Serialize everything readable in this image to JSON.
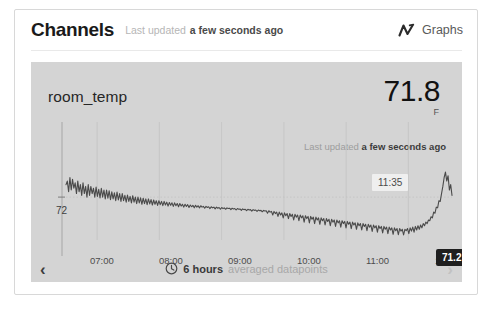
{
  "header": {
    "title": "Channels",
    "updated_prefix": "Last updated",
    "updated_value": "a few seconds ago",
    "graphs_label": "Graphs",
    "graphs_icon": "line-chart-icon"
  },
  "panel": {
    "series_name": "room_temp",
    "current_value": "71.8",
    "unit": "F",
    "updated_prefix": "Last updated",
    "updated_value": "a few seconds ago",
    "time_marker": "11:35",
    "tooltip_value": "71.2 F",
    "footer_bold": "6 hours",
    "footer_dim": "averaged datapoints",
    "footer_icon": "clock-icon",
    "nav_prev": "‹",
    "nav_next": "›",
    "bg_color": "#d4d4d4",
    "line_color": "#4a4a4a",
    "tooltip_bg": "#1f1f1f",
    "marker_bg": "#efefef"
  },
  "chart_data": {
    "type": "line",
    "title": "room_temp",
    "xlabel": "",
    "ylabel": "",
    "grid": true,
    "legend": "none",
    "xlim": [
      "06:30",
      "12:00"
    ],
    "ylim": [
      70.8,
      72.9
    ],
    "yticks": [
      72
    ],
    "ytick_labels": [
      "72"
    ],
    "xticks": [
      "07:00",
      "08:00",
      "09:00",
      "10:00",
      "11:00",
      "12:00"
    ],
    "annotations": [
      {
        "label": "11:35",
        "type": "time-marker"
      },
      {
        "label": "71.2 F",
        "type": "value-tooltip"
      }
    ],
    "series": [
      {
        "name": "room_temp",
        "unit": "F",
        "values": [
          72.35,
          72.45,
          72.15,
          72.55,
          72.2,
          72.5,
          72.25,
          72.4,
          72.1,
          72.45,
          72.15,
          72.35,
          72.05,
          72.4,
          72.1,
          72.3,
          72.0,
          72.35,
          72.05,
          72.3,
          72.1,
          72.25,
          72.0,
          72.28,
          72.02,
          72.22,
          71.98,
          72.25,
          72.0,
          72.2,
          71.95,
          72.2,
          71.97,
          72.18,
          71.93,
          72.15,
          71.95,
          72.12,
          71.9,
          72.14,
          71.92,
          72.1,
          71.88,
          72.1,
          71.9,
          72.05,
          71.86,
          72.06,
          71.88,
          72.02,
          71.84,
          72.04,
          71.86,
          72.0,
          71.82,
          72.0,
          71.84,
          71.98,
          71.8,
          71.97,
          71.82,
          71.95,
          71.79,
          71.95,
          71.81,
          71.93,
          71.78,
          71.92,
          71.8,
          71.9,
          71.77,
          71.9,
          71.79,
          71.88,
          71.76,
          71.88,
          71.78,
          71.86,
          71.75,
          71.85,
          71.77,
          71.84,
          71.74,
          71.84,
          71.76,
          71.82,
          71.73,
          71.82,
          71.75,
          71.8,
          71.72,
          71.8,
          71.74,
          71.79,
          71.71,
          71.78,
          71.73,
          71.77,
          71.7,
          71.77,
          71.72,
          71.76,
          71.7,
          71.76,
          71.72,
          71.74,
          71.69,
          71.74,
          71.71,
          71.73,
          71.68,
          71.73,
          71.7,
          71.72,
          71.67,
          71.72,
          71.69,
          71.71,
          71.66,
          71.71,
          71.68,
          71.7,
          71.66,
          71.7,
          71.68,
          71.69,
          71.65,
          71.69,
          71.67,
          71.68,
          71.64,
          71.68,
          71.66,
          71.67,
          71.63,
          71.67,
          71.65,
          71.66,
          71.62,
          71.66,
          71.64,
          71.65,
          71.61,
          71.65,
          71.63,
          71.64,
          71.6,
          71.64,
          71.62,
          71.63,
          71.59,
          71.63,
          71.61,
          71.62,
          71.55,
          71.62,
          71.58,
          71.6,
          71.5,
          71.6,
          71.54,
          71.58,
          71.46,
          71.58,
          71.5,
          71.56,
          71.42,
          71.56,
          71.48,
          71.54,
          71.4,
          71.54,
          71.46,
          71.52,
          71.36,
          71.52,
          71.44,
          71.5,
          71.34,
          71.5,
          71.42,
          71.48,
          71.3,
          71.48,
          71.4,
          71.46,
          71.28,
          71.46,
          71.38,
          71.44,
          71.26,
          71.44,
          71.36,
          71.42,
          71.24,
          71.42,
          71.34,
          71.4,
          71.22,
          71.4,
          71.32,
          71.38,
          71.2,
          71.38,
          71.3,
          71.36,
          71.18,
          71.36,
          71.28,
          71.34,
          71.16,
          71.34,
          71.26,
          71.32,
          71.14,
          71.32,
          71.24,
          71.3,
          71.12,
          71.3,
          71.22,
          71.28,
          71.1,
          71.28,
          71.2,
          71.26,
          71.08,
          71.26,
          71.18,
          71.24,
          71.06,
          71.24,
          71.16,
          71.22,
          71.04,
          71.22,
          71.14,
          71.2,
          71.02,
          71.2,
          71.12,
          71.18,
          71.0,
          71.18,
          71.1,
          71.16,
          70.98,
          71.16,
          71.08,
          71.14,
          70.96,
          71.14,
          71.06,
          71.12,
          70.95,
          71.12,
          71.05,
          71.1,
          70.94,
          71.1,
          71.06,
          71.12,
          70.98,
          71.14,
          71.05,
          71.16,
          71.02,
          71.18,
          71.08,
          71.2,
          71.1,
          71.22,
          71.14,
          71.26,
          71.2,
          71.3,
          71.26,
          71.36,
          71.34,
          71.45,
          71.42,
          71.58,
          71.55,
          71.72,
          71.7,
          71.9,
          71.88,
          72.1,
          72.3,
          72.55,
          72.7,
          72.45,
          72.6,
          72.2,
          72.35,
          72.05
        ]
      }
    ]
  }
}
